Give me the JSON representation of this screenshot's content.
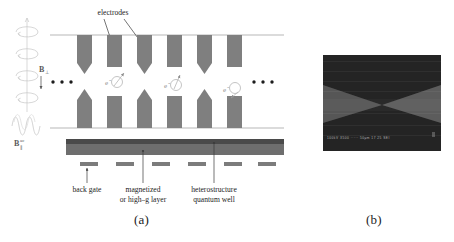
{
  "figure": {
    "panels": [
      {
        "id": "a",
        "caption": "(a)",
        "type": "schematic"
      },
      {
        "id": "b",
        "caption": "(b)",
        "type": "sem-micrograph"
      }
    ]
  },
  "schematic": {
    "labels": {
      "electrodes": "electrodes",
      "back_gate": "back gate",
      "magnetized_layer_line1": "magnetized",
      "magnetized_layer_line2": "or high–g layer",
      "heterostructure_line1": "heterostructure",
      "heterostructure_line2": "quantum well",
      "electron_1": "e",
      "electron_2": "e",
      "electron_3": "e",
      "electron_superscript": "-",
      "field_static": "B",
      "field_static_subscript": "⊥",
      "field_ac": "B",
      "field_ac_subscript": "∥",
      "field_ac_superscript": "ac",
      "ellipsis_left": "• • •",
      "ellipsis_right": "• • •"
    },
    "colors": {
      "electrode_fill": "#7f7f7f",
      "quantum_well_fill": "#6e6e6e",
      "quantum_well_top_edge": "#4a4a4a",
      "back_gate_fill": "#7c7c7c",
      "guide_line": "#9a9a9a",
      "annotation_line": "#3a3a3a",
      "coil_stroke": "#c9c9c9",
      "spin_stroke": "#b5b5b5",
      "text": "#232323",
      "background": "#ffffff"
    },
    "electrodes": {
      "top_row": [
        {
          "index": 1,
          "shape": "pointed",
          "x": 62
        },
        {
          "index": 2,
          "shape": "flat",
          "x": 106
        },
        {
          "index": 3,
          "shape": "pointed",
          "x": 140
        },
        {
          "index": 4,
          "shape": "flat",
          "x": 168
        },
        {
          "index": 5,
          "shape": "pointed",
          "x": 196
        },
        {
          "index": 6,
          "shape": "flat",
          "x": 226
        }
      ],
      "bottom_row": [
        {
          "index": 1,
          "shape": "pointed",
          "x": 62
        },
        {
          "index": 2,
          "shape": "flat",
          "x": 106
        },
        {
          "index": 3,
          "shape": "pointed",
          "x": 140
        },
        {
          "index": 4,
          "shape": "flat",
          "x": 168
        },
        {
          "index": 5,
          "shape": "pointed",
          "x": 196
        },
        {
          "index": 6,
          "shape": "flat",
          "x": 226
        }
      ]
    },
    "back_gates_count": 6,
    "electrons_count": 3
  },
  "sem": {
    "status_bar_text": "100kV   X500  ·····  50μm   17 25 SEI",
    "colors": {
      "background": "#2f2f2f",
      "dark_region": "#262626",
      "light_region": "#585858",
      "border": "#1d1d1d"
    }
  }
}
